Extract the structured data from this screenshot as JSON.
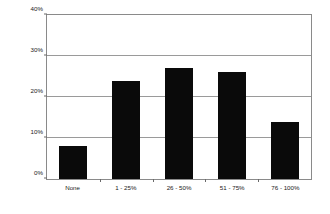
{
  "chart_data": {
    "type": "bar",
    "title": "",
    "subtitle": "",
    "xlabel": "",
    "ylabel": "Percent of respondents",
    "categories": [
      "None",
      "1 - 25%",
      "26 - 50%",
      "51 - 75%",
      "76 - 100%"
    ],
    "values": [
      8,
      24,
      27,
      26,
      14
    ],
    "series": [
      {
        "name": "Percent of respondents",
        "values": [
          8,
          24,
          27,
          26,
          14
        ]
      }
    ],
    "ylim": [
      0,
      40
    ],
    "yticks": [
      0,
      10,
      20,
      30,
      40
    ],
    "ytick_labels": [
      "0%",
      "10%",
      "20%",
      "30%",
      "40%"
    ],
    "grid": true,
    "grid_axis": "y",
    "legend": false,
    "legend_position": "none",
    "bar_color": "#0a0a0a",
    "plot_border_color": "#8a8a8a",
    "gridline_color": "#9a9a9a",
    "background_color": "#ffffff"
  }
}
